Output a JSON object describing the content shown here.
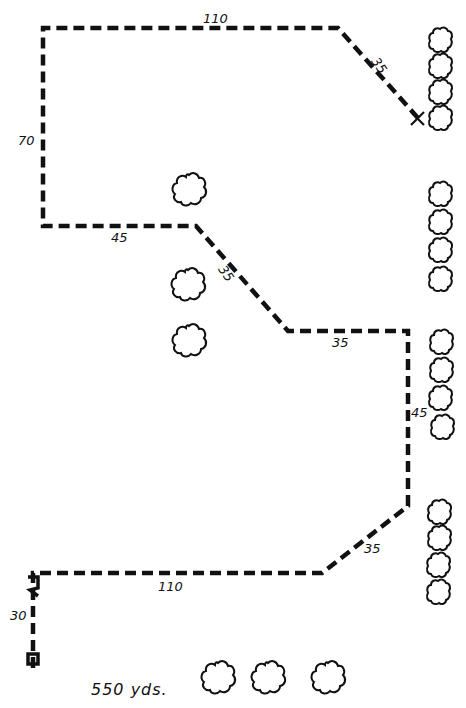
{
  "diagram": {
    "type": "course-route-map",
    "total_distance_label": "550 yds.",
    "segments": [
      {
        "id": "seg-1",
        "label": "30",
        "direction": "up"
      },
      {
        "id": "seg-2",
        "label": "110",
        "direction": "right"
      },
      {
        "id": "seg-3",
        "label": "35",
        "direction": "diagonal-up-right"
      },
      {
        "id": "seg-4",
        "label": "45",
        "direction": "up"
      },
      {
        "id": "seg-5",
        "label": "35",
        "direction": "left"
      },
      {
        "id": "seg-6",
        "label": "35",
        "direction": "diagonal-up-left"
      },
      {
        "id": "seg-7",
        "label": "45",
        "direction": "left"
      },
      {
        "id": "seg-8",
        "label": "70",
        "direction": "up"
      },
      {
        "id": "seg-9",
        "label": "110",
        "direction": "right"
      },
      {
        "id": "seg-10",
        "label": "35",
        "direction": "diagonal-down-right"
      }
    ],
    "start_marker": "start-post-icon",
    "end_marker": "x-mark-icon",
    "tree_icon": "tree-icon",
    "tree_groups": [
      {
        "name": "right-column-top",
        "count": 4
      },
      {
        "name": "right-column-upper-middle",
        "count": 4
      },
      {
        "name": "right-column-lower-middle",
        "count": 4
      },
      {
        "name": "right-column-bottom",
        "count": 4
      },
      {
        "name": "left-middle-single",
        "count": 1
      },
      {
        "name": "left-middle-pair",
        "count": 2
      },
      {
        "name": "bottom-row",
        "count": 3
      }
    ],
    "colors": {
      "line": "#111111",
      "background": "#ffffff"
    }
  }
}
